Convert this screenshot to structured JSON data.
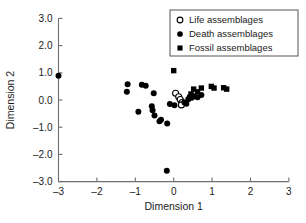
{
  "chart_data": {
    "type": "scatter",
    "title": "",
    "xlabel": "Dimension 1",
    "ylabel": "Dimension 2",
    "xlim": [
      -3,
      3
    ],
    "ylim": [
      -3.0,
      3.0
    ],
    "xticks": [
      -3,
      -2,
      -1,
      0,
      1,
      2,
      3
    ],
    "xtick_labels": [
      "–3",
      "–2",
      "–1",
      "0",
      "1",
      "2",
      "3"
    ],
    "yticks": [
      3.0,
      2.0,
      1.0,
      0.0,
      -1.0,
      -2.0,
      -3.0
    ],
    "ytick_labels": [
      "3.0",
      "2.0",
      "1.0",
      "0.0",
      "–1.0",
      "–2.0",
      "–3.0"
    ],
    "grid": false,
    "legend_position": "top-right",
    "series": [
      {
        "name": "Life assemblages",
        "marker": "open-circle",
        "color": "#ffffff",
        "edge_color": "#000000",
        "points": [
          [
            0.05,
            0.25
          ],
          [
            0.13,
            0.12
          ],
          [
            0.17,
            0.02
          ],
          [
            0.22,
            -0.09
          ],
          [
            0.2,
            -0.18
          ]
        ]
      },
      {
        "name": "Death assemblages",
        "marker": "filled-circle",
        "color": "#000000",
        "points": [
          [
            -3.0,
            0.89
          ],
          [
            -1.2,
            0.58
          ],
          [
            -1.22,
            0.3
          ],
          [
            -0.83,
            0.56
          ],
          [
            -0.73,
            0.52
          ],
          [
            -0.52,
            0.25
          ],
          [
            -0.92,
            -0.43
          ],
          [
            -0.57,
            -0.23
          ],
          [
            -0.55,
            -0.38
          ],
          [
            -0.5,
            -0.57
          ],
          [
            -0.37,
            -0.78
          ],
          [
            -0.33,
            -0.73
          ],
          [
            -0.17,
            -0.86
          ],
          [
            -0.1,
            -0.15
          ],
          [
            0.02,
            -0.19
          ],
          [
            0.28,
            -0.09
          ],
          [
            0.33,
            -0.14
          ],
          [
            0.38,
            0.03
          ],
          [
            0.42,
            0.12
          ],
          [
            0.47,
            0.08
          ],
          [
            0.53,
            0.14
          ],
          [
            0.62,
            0.1
          ],
          [
            0.72,
            0.18
          ],
          [
            -0.18,
            -2.6
          ]
        ]
      },
      {
        "name": "Fossil assemblages",
        "marker": "filled-square",
        "color": "#000000",
        "points": [
          [
            0.0,
            1.08
          ],
          [
            0.45,
            0.22
          ],
          [
            0.52,
            0.4
          ],
          [
            0.62,
            0.3
          ],
          [
            0.72,
            0.44
          ],
          [
            0.98,
            0.5
          ],
          [
            1.05,
            0.44
          ],
          [
            1.3,
            0.45
          ],
          [
            1.38,
            0.4
          ]
        ]
      }
    ]
  },
  "legend": {
    "items": [
      {
        "label": "Life assemblages",
        "marker": "open-circle"
      },
      {
        "label": "Death assemblages",
        "marker": "filled-circle"
      },
      {
        "label": "Fossil assemblages",
        "marker": "filled-square"
      }
    ]
  },
  "axes": {
    "x_title": "Dimension 1",
    "y_title": "Dimension 2"
  }
}
